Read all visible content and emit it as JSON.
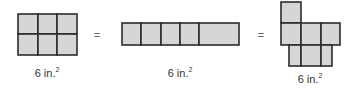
{
  "figures": [
    {
      "name": "rectangle-2x3",
      "label_value": "6 in.",
      "label_exp": "2"
    },
    {
      "name": "rectangle-1x5",
      "label_value": "6 in.",
      "label_exp": "2"
    },
    {
      "name": "irregular-shape",
      "label_value": "6 in.",
      "label_exp": "2"
    }
  ],
  "operators": [
    "=",
    "="
  ],
  "colors": {
    "fill": "#d6d6d6",
    "stroke": "#2b2b2b"
  }
}
